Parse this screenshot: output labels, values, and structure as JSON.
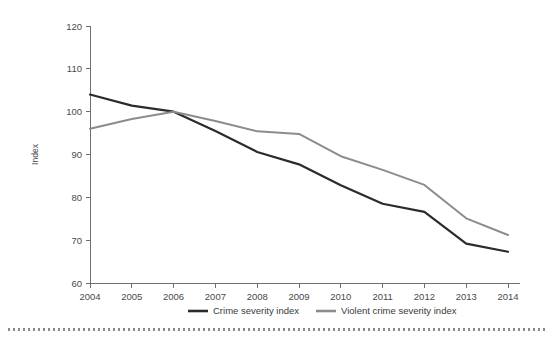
{
  "chart_data": {
    "type": "line",
    "title": "",
    "xlabel": "",
    "ylabel": "Index",
    "x": [
      2004,
      2005,
      2006,
      2007,
      2008,
      2009,
      2010,
      2011,
      2012,
      2013,
      2014
    ],
    "xtick_labels": [
      "2004",
      "2005",
      "2006",
      "2007",
      "2008",
      "2009",
      "2010",
      "2011",
      "2012",
      "2013",
      "2014"
    ],
    "ytick_labels": [
      "60",
      "70",
      "80",
      "90",
      "100",
      "110",
      "120"
    ],
    "yticks": [
      60,
      70,
      80,
      90,
      100,
      110,
      120
    ],
    "ylim": [
      60,
      120
    ],
    "xlim": [
      2004,
      2014
    ],
    "grid": false,
    "legend_position": "bottom",
    "series": [
      {
        "name": "Crime severity index",
        "color": "#2b2b2b",
        "values": [
          104.0,
          101.4,
          100.0,
          95.5,
          90.6,
          87.7,
          82.8,
          78.5,
          76.6,
          69.2,
          67.3
        ]
      },
      {
        "name": "Violent crime severity index",
        "color": "#8c8c8c",
        "values": [
          96.0,
          98.3,
          100.0,
          97.8,
          95.4,
          94.8,
          89.6,
          86.4,
          82.9,
          75.1,
          71.2
        ]
      }
    ]
  },
  "legend": {
    "items": [
      {
        "label": "Crime severity index",
        "color": "#2b2b2b"
      },
      {
        "label": "Violent crime severity index",
        "color": "#8c8c8c"
      }
    ]
  }
}
